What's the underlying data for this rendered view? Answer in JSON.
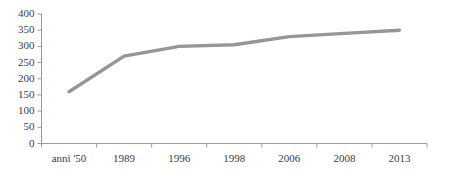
{
  "chart_data": {
    "type": "line",
    "title": "",
    "subtitle": "",
    "xlabel": "",
    "ylabel": "",
    "categories": [
      "anni '50",
      "1989",
      "1996",
      "1998",
      "2006",
      "2008",
      "2013"
    ],
    "series": [
      {
        "name": "serie",
        "color": "#969696",
        "values": [
          160,
          270,
          300,
          305,
          330,
          340,
          350
        ]
      }
    ],
    "ylim": [
      0,
      400
    ],
    "ytick_step": 50,
    "ytick_labels": [
      "0",
      "50",
      "100",
      "150",
      "200",
      "250",
      "300",
      "350",
      "400"
    ],
    "ytick_values": [
      0,
      50,
      100,
      150,
      200,
      250,
      300,
      350,
      400
    ],
    "grid": false,
    "legend": false,
    "legend_position": "none",
    "axis_color": "#9a9a9a",
    "text_color": "#3d3d3d",
    "background": "#ffffff"
  }
}
